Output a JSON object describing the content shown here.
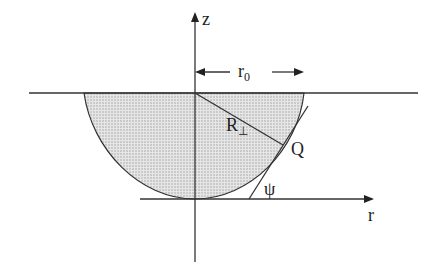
{
  "diagram": {
    "labels": {
      "z_axis": "z",
      "r_axis": "r",
      "r0_main": "r",
      "r0_sub": "0",
      "R_main": "R",
      "R_sub": "⊥",
      "Q": "Q",
      "psi": "ψ"
    },
    "colors": {
      "stroke": "#333333",
      "fill": "#d8d8d8"
    }
  }
}
